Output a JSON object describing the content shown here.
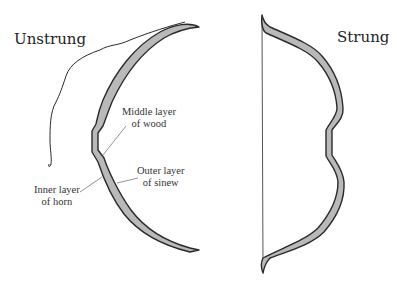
{
  "diagram": {
    "panels": [
      {
        "id": "unstrung",
        "title": "Unstrung",
        "labels": [
          {
            "id": "middle",
            "line1": "Middle layer",
            "line2": "of wood"
          },
          {
            "id": "outer",
            "line1": "Outer layer",
            "line2": "of sinew"
          },
          {
            "id": "inner",
            "line1": "Inner layer",
            "line2": "of horn"
          }
        ]
      },
      {
        "id": "strung",
        "title": "Strung"
      }
    ],
    "colors": {
      "outline": "#2a2a2a",
      "core_fill": "#b9b9b9",
      "string": "#555555",
      "leader": "#777777",
      "background": "#ffffff"
    }
  }
}
